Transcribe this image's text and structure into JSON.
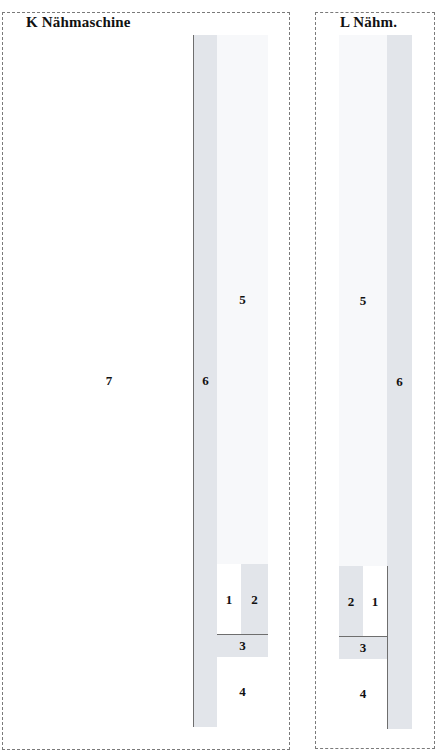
{
  "panels": {
    "K": {
      "title": "K  Nähmaschine",
      "cells": {
        "c7": "7",
        "c6": "6",
        "c5": "5",
        "c1": "1",
        "c2": "2",
        "c3": "3",
        "c4": "4"
      }
    },
    "L": {
      "title": "L  Nähm.",
      "cells": {
        "c5": "5",
        "c6": "6",
        "c2": "2",
        "c1": "1",
        "c3": "3",
        "c4": "4"
      }
    }
  },
  "colors": {
    "border": "#6e6e6e",
    "dashed": "#7a7a7a",
    "shaded": "#e2e5ea",
    "light": "#f7f8fa",
    "white": "#ffffff"
  }
}
